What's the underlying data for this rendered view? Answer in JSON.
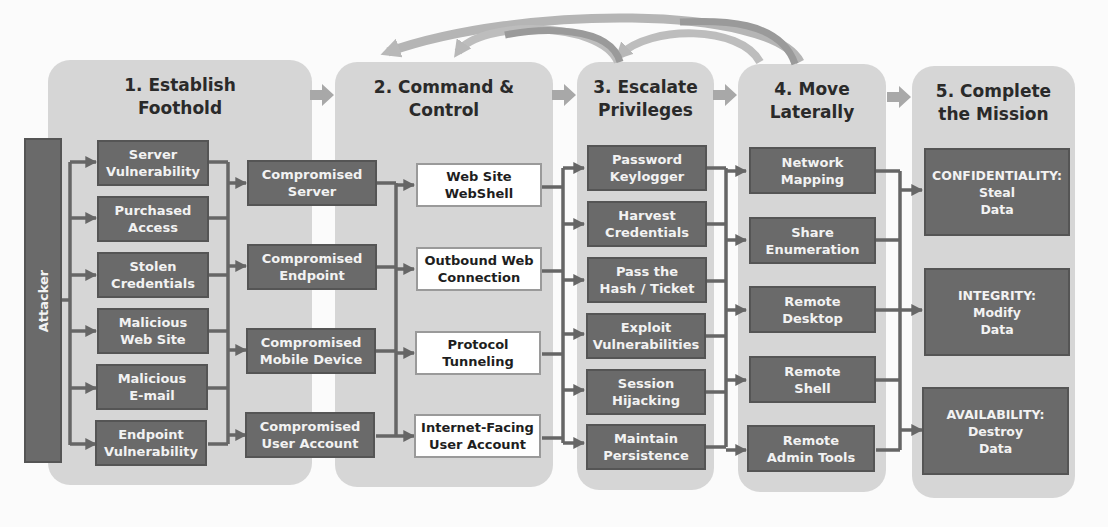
{
  "diagram": {
    "attacker_label": "Attacker",
    "stages": [
      {
        "title_line1": "1. Establish",
        "title_line2": "Foothold",
        "items": [
          {
            "l1": "Server",
            "l2": "Vulnerability"
          },
          {
            "l1": "Purchased",
            "l2": "Access"
          },
          {
            "l1": "Stolen",
            "l2": "Credentials"
          },
          {
            "l1": "Malicious",
            "l2": "Web Site"
          },
          {
            "l1": "Malicious",
            "l2": "E-mail"
          },
          {
            "l1": "Endpoint",
            "l2": "Vulnerability"
          }
        ],
        "results": [
          {
            "l1": "Compromised",
            "l2": "Server"
          },
          {
            "l1": "Compromised",
            "l2": "Endpoint"
          },
          {
            "l1": "Compromised",
            "l2": "Mobile Device"
          },
          {
            "l1": "Compromised",
            "l2": "User Account"
          }
        ]
      },
      {
        "title_line1": "2. Command &",
        "title_line2": "Control",
        "items": [
          {
            "l1": "Web Site",
            "l2": "WebShell"
          },
          {
            "l1": "Outbound Web",
            "l2": "Connection"
          },
          {
            "l1": "Protocol",
            "l2": "Tunneling"
          },
          {
            "l1": "Internet-Facing",
            "l2": "User Account"
          }
        ]
      },
      {
        "title_line1": "3. Escalate",
        "title_line2": "Privileges",
        "items": [
          {
            "l1": "Password",
            "l2": "Keylogger"
          },
          {
            "l1": "Harvest",
            "l2": "Credentials"
          },
          {
            "l1": "Pass the",
            "l2": "Hash / Ticket"
          },
          {
            "l1": "Exploit",
            "l2": "Vulnerabilities"
          },
          {
            "l1": "Session",
            "l2": "Hijacking"
          },
          {
            "l1": "Maintain",
            "l2": "Persistence"
          }
        ]
      },
      {
        "title_line1": "4. Move",
        "title_line2": "Laterally",
        "items": [
          {
            "l1": "Network",
            "l2": "Mapping"
          },
          {
            "l1": "Share",
            "l2": "Enumeration"
          },
          {
            "l1": "Remote",
            "l2": "Desktop"
          },
          {
            "l1": "Remote",
            "l2": "Shell"
          },
          {
            "l1": "Remote",
            "l2": "Admin Tools"
          }
        ]
      },
      {
        "title_line1": "5. Complete",
        "title_line2": "the Mission",
        "items": [
          {
            "l1": "CONFIDENTIALITY:",
            "l2": "Steal",
            "l3": "Data"
          },
          {
            "l1": "INTEGRITY:",
            "l2": "Modify",
            "l3": "Data"
          },
          {
            "l1": "AVAILABILITY:",
            "l2": "Destroy",
            "l3": "Data"
          }
        ]
      }
    ],
    "colors": {
      "panel": "#d6d6d6",
      "dark_box": "#6a6a6a",
      "light_box": "#ffffff",
      "connector": "#666666",
      "stage_arrow": "#a8a8a8"
    }
  }
}
